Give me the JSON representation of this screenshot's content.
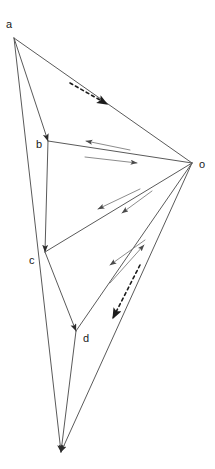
{
  "figure": {
    "canvas": {
      "width": 215,
      "height": 469
    },
    "background_color": "#ffffff",
    "line_color": "#5a5a5a",
    "accent_line_color": "#8c8c8c",
    "arrowhead_color": "#333333",
    "label_color": "#1a1a1a"
  },
  "vertices": [
    {
      "id": "a",
      "label": "a",
      "x": 14,
      "y": 38,
      "label_x": 6,
      "label_y": 28
    },
    {
      "id": "b",
      "label": "b",
      "x": 48,
      "y": 141,
      "label_x": 36,
      "label_y": 148
    },
    {
      "id": "c",
      "label": "c",
      "x": 45,
      "y": 252,
      "label_x": 29,
      "label_y": 264
    },
    {
      "id": "d",
      "label": "d",
      "x": 76,
      "y": 331,
      "label_x": 83,
      "label_y": 342
    },
    {
      "id": "o",
      "label": "o",
      "x": 192,
      "y": 163,
      "label_x": 199,
      "label_y": 168
    },
    {
      "id": "e",
      "label": "",
      "x": 61,
      "y": 452,
      "label_x": 0,
      "label_y": 0
    }
  ],
  "edges": [
    {
      "name": "edge-a-b",
      "from": "a",
      "to": "b",
      "arrow": "end",
      "style": "solid"
    },
    {
      "name": "edge-a-o",
      "from": "a",
      "to": "o",
      "arrow": "none",
      "style": "solid"
    },
    {
      "name": "edge-a-e",
      "from": "a",
      "to": "e",
      "arrow": "end",
      "style": "solid"
    },
    {
      "name": "edge-b-c",
      "from": "b",
      "to": "c",
      "arrow": "end",
      "style": "solid"
    },
    {
      "name": "edge-b-o",
      "from": "b",
      "to": "o",
      "arrow": "none",
      "style": "solid"
    },
    {
      "name": "edge-c-o",
      "from": "c",
      "to": "o",
      "arrow": "none",
      "style": "solid"
    },
    {
      "name": "edge-c-d",
      "from": "c",
      "to": "d",
      "arrow": "end",
      "style": "solid"
    },
    {
      "name": "edge-d-o",
      "from": "d",
      "to": "o",
      "arrow": "none",
      "style": "solid"
    },
    {
      "name": "edge-d-e",
      "from": "d",
      "to": "e",
      "arrow": "end",
      "style": "solid"
    },
    {
      "name": "edge-o-e",
      "from": "o",
      "to": "e",
      "arrow": "end",
      "style": "solid"
    }
  ],
  "vector_arrows": [
    {
      "name": "arrow-dashed-a-to-o",
      "style": "dashed",
      "x1": 70,
      "y1": 83,
      "x2": 107,
      "y2": 104,
      "direction": "down-right",
      "along": "a-o"
    },
    {
      "name": "arrow-o-to-b-upper",
      "style": "solid",
      "x1": 130,
      "y1": 150,
      "x2": 86,
      "y2": 141,
      "direction": "left",
      "along": "b-o"
    },
    {
      "name": "arrow-b-to-o-lower",
      "style": "solid",
      "x1": 85,
      "y1": 157,
      "x2": 137,
      "y2": 163,
      "direction": "right",
      "along": "b-o"
    },
    {
      "name": "arrow-o-to-c-upper",
      "style": "solid",
      "x1": 140,
      "y1": 189,
      "x2": 98,
      "y2": 209,
      "direction": "up-left",
      "along": "c-o"
    },
    {
      "name": "arrow-o-to-c-lower",
      "style": "solid",
      "x1": 152,
      "y1": 191,
      "x2": 122,
      "y2": 213,
      "direction": "down-left",
      "along": "c-o"
    },
    {
      "name": "arrow-d-to-o",
      "style": "solid",
      "x1": 110,
      "y1": 283,
      "x2": 144,
      "y2": 245,
      "direction": "up-right",
      "along": "d-o"
    },
    {
      "name": "arrow-o-to-d",
      "style": "solid",
      "x1": 145,
      "y1": 240,
      "x2": 110,
      "y2": 265,
      "direction": "down-left",
      "along": "d-o"
    },
    {
      "name": "arrow-dashed-o-to-d",
      "style": "dashed",
      "x1": 140,
      "y1": 265,
      "x2": 113,
      "y2": 318,
      "direction": "down-left",
      "along": "d-o"
    }
  ],
  "legend": {
    "vertex_labels": [
      "a",
      "b",
      "c",
      "d",
      "o"
    ]
  }
}
